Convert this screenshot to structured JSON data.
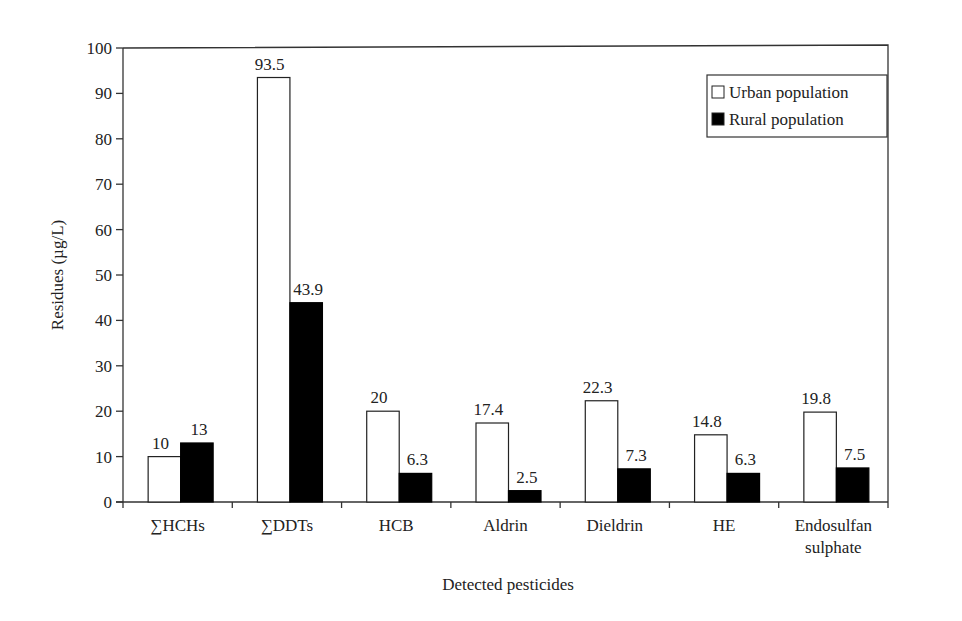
{
  "chart_data": {
    "type": "bar",
    "title": "",
    "xlabel": "Detected pesticides",
    "ylabel": "Residues (µg/L)",
    "ylim": [
      0,
      100
    ],
    "yticks": [
      0,
      10,
      20,
      30,
      40,
      50,
      60,
      70,
      80,
      90,
      100
    ],
    "grid": false,
    "legend_position": "upper right",
    "categories": [
      "∑HCHs",
      "∑DDTs",
      "HCB",
      "Aldrin",
      "Dieldrin",
      "HE",
      "Endosulfan sulphate"
    ],
    "category_lines": [
      [
        "∑HCHs"
      ],
      [
        "∑DDTs"
      ],
      [
        "HCB"
      ],
      [
        "Aldrin"
      ],
      [
        "Dieldrin"
      ],
      [
        "HE"
      ],
      [
        "Endosulfan",
        "sulphate"
      ]
    ],
    "series": [
      {
        "name": "Urban population",
        "color": "#ffffff",
        "edge": "#222222",
        "values": [
          10,
          93.5,
          20,
          17.4,
          22.3,
          14.8,
          19.8
        ],
        "labels": [
          "10",
          "93.5",
          "20",
          "17.4",
          "22.3",
          "14.8",
          "19.8"
        ]
      },
      {
        "name": "Rural population",
        "color": "#000000",
        "edge": "#000000",
        "values": [
          13,
          43.9,
          6.3,
          2.5,
          7.3,
          6.3,
          7.5
        ],
        "labels": [
          "13",
          "43.9",
          "6.3",
          "2.5",
          "7.3",
          "6.3",
          "7.5"
        ]
      }
    ]
  }
}
